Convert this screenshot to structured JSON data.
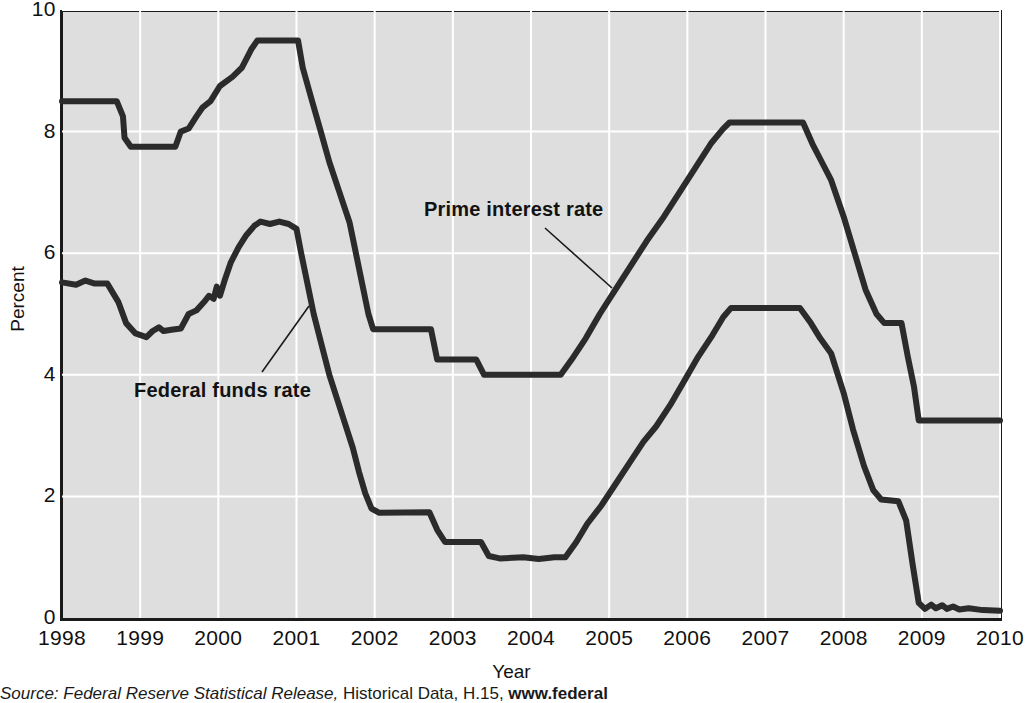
{
  "chart_data": {
    "type": "line",
    "title": "",
    "xlabel": "Year",
    "ylabel": "Percent",
    "xlim": [
      1998,
      2010
    ],
    "ylim": [
      0,
      10
    ],
    "xticks": [
      1998,
      1999,
      2000,
      2001,
      2002,
      2003,
      2004,
      2005,
      2006,
      2007,
      2008,
      2009,
      2010
    ],
    "yticks": [
      0,
      2,
      4,
      6,
      8,
      10
    ],
    "grid": true,
    "legend_position": "inline-annotation",
    "line_color": "#2b2b2b",
    "plot_background": "#dedede",
    "gridline_color": "#ffffff",
    "series": [
      {
        "name": "Prime interest rate",
        "label_position": {
          "x": 424,
          "y": 198
        },
        "points": [
          [
            1998.0,
            8.5
          ],
          [
            1998.7,
            8.5
          ],
          [
            1998.78,
            8.25
          ],
          [
            1998.8,
            7.9
          ],
          [
            1998.88,
            7.75
          ],
          [
            1999.45,
            7.75
          ],
          [
            1999.52,
            8.0
          ],
          [
            1999.62,
            8.05
          ],
          [
            1999.72,
            8.25
          ],
          [
            1999.8,
            8.4
          ],
          [
            1999.9,
            8.5
          ],
          [
            2000.02,
            8.75
          ],
          [
            2000.18,
            8.9
          ],
          [
            2000.3,
            9.05
          ],
          [
            2000.42,
            9.35
          ],
          [
            2000.5,
            9.5
          ],
          [
            2001.02,
            9.5
          ],
          [
            2001.08,
            9.05
          ],
          [
            2001.2,
            8.5
          ],
          [
            2001.3,
            8.05
          ],
          [
            2001.42,
            7.5
          ],
          [
            2001.55,
            7.0
          ],
          [
            2001.68,
            6.5
          ],
          [
            2001.76,
            6.0
          ],
          [
            2001.84,
            5.5
          ],
          [
            2001.92,
            5.0
          ],
          [
            2001.98,
            4.75
          ],
          [
            2002.72,
            4.75
          ],
          [
            2002.8,
            4.25
          ],
          [
            2003.3,
            4.25
          ],
          [
            2003.4,
            4.0
          ],
          [
            2004.38,
            4.0
          ],
          [
            2004.52,
            4.25
          ],
          [
            2004.7,
            4.6
          ],
          [
            2004.88,
            5.0
          ],
          [
            2005.08,
            5.4
          ],
          [
            2005.28,
            5.8
          ],
          [
            2005.48,
            6.2
          ],
          [
            2005.7,
            6.6
          ],
          [
            2005.9,
            7.0
          ],
          [
            2006.1,
            7.4
          ],
          [
            2006.3,
            7.8
          ],
          [
            2006.46,
            8.05
          ],
          [
            2006.54,
            8.15
          ],
          [
            2007.48,
            8.15
          ],
          [
            2007.6,
            7.8
          ],
          [
            2007.72,
            7.5
          ],
          [
            2007.84,
            7.2
          ],
          [
            2008.0,
            6.6
          ],
          [
            2008.14,
            6.0
          ],
          [
            2008.28,
            5.4
          ],
          [
            2008.42,
            5.0
          ],
          [
            2008.52,
            4.85
          ],
          [
            2008.74,
            4.85
          ],
          [
            2008.82,
            4.3
          ],
          [
            2008.9,
            3.8
          ],
          [
            2008.96,
            3.25
          ],
          [
            2010.0,
            3.25
          ]
        ]
      },
      {
        "name": "Federal funds rate",
        "label_position": {
          "x": 134,
          "y": 379
        },
        "points": [
          [
            1998.0,
            5.52
          ],
          [
            1998.18,
            5.48
          ],
          [
            1998.3,
            5.55
          ],
          [
            1998.42,
            5.5
          ],
          [
            1998.58,
            5.5
          ],
          [
            1998.72,
            5.2
          ],
          [
            1998.82,
            4.85
          ],
          [
            1998.94,
            4.68
          ],
          [
            1999.08,
            4.62
          ],
          [
            1999.16,
            4.72
          ],
          [
            1999.24,
            4.78
          ],
          [
            1999.3,
            4.72
          ],
          [
            1999.4,
            4.74
          ],
          [
            1999.52,
            4.76
          ],
          [
            1999.62,
            5.0
          ],
          [
            1999.72,
            5.06
          ],
          [
            1999.82,
            5.2
          ],
          [
            1999.88,
            5.3
          ],
          [
            1999.94,
            5.25
          ],
          [
            1999.98,
            5.45
          ],
          [
            2000.02,
            5.3
          ],
          [
            2000.08,
            5.55
          ],
          [
            2000.16,
            5.85
          ],
          [
            2000.26,
            6.1
          ],
          [
            2000.36,
            6.3
          ],
          [
            2000.46,
            6.45
          ],
          [
            2000.54,
            6.52
          ],
          [
            2000.66,
            6.48
          ],
          [
            2000.78,
            6.52
          ],
          [
            2000.9,
            6.48
          ],
          [
            2001.0,
            6.4
          ],
          [
            2001.06,
            6.0
          ],
          [
            2001.14,
            5.5
          ],
          [
            2001.22,
            5.0
          ],
          [
            2001.32,
            4.5
          ],
          [
            2001.42,
            4.0
          ],
          [
            2001.52,
            3.6
          ],
          [
            2001.62,
            3.2
          ],
          [
            2001.72,
            2.8
          ],
          [
            2001.8,
            2.4
          ],
          [
            2001.88,
            2.05
          ],
          [
            2001.96,
            1.8
          ],
          [
            2002.06,
            1.73
          ],
          [
            2002.7,
            1.74
          ],
          [
            2002.8,
            1.45
          ],
          [
            2002.9,
            1.25
          ],
          [
            2003.36,
            1.25
          ],
          [
            2003.46,
            1.02
          ],
          [
            2003.6,
            0.98
          ],
          [
            2003.9,
            1.0
          ],
          [
            2004.1,
            0.97
          ],
          [
            2004.3,
            1.0
          ],
          [
            2004.44,
            1.0
          ],
          [
            2004.58,
            1.25
          ],
          [
            2004.72,
            1.55
          ],
          [
            2004.9,
            1.85
          ],
          [
            2005.08,
            2.2
          ],
          [
            2005.26,
            2.55
          ],
          [
            2005.44,
            2.9
          ],
          [
            2005.6,
            3.15
          ],
          [
            2005.78,
            3.5
          ],
          [
            2005.96,
            3.9
          ],
          [
            2006.14,
            4.3
          ],
          [
            2006.32,
            4.65
          ],
          [
            2006.46,
            4.95
          ],
          [
            2006.56,
            5.1
          ],
          [
            2007.44,
            5.1
          ],
          [
            2007.58,
            4.85
          ],
          [
            2007.7,
            4.6
          ],
          [
            2007.84,
            4.35
          ],
          [
            2008.0,
            3.7
          ],
          [
            2008.12,
            3.1
          ],
          [
            2008.26,
            2.5
          ],
          [
            2008.38,
            2.1
          ],
          [
            2008.48,
            1.95
          ],
          [
            2008.7,
            1.92
          ],
          [
            2008.8,
            1.6
          ],
          [
            2008.88,
            0.9
          ],
          [
            2008.96,
            0.25
          ],
          [
            2009.04,
            0.15
          ],
          [
            2009.12,
            0.22
          ],
          [
            2009.18,
            0.16
          ],
          [
            2009.26,
            0.21
          ],
          [
            2009.32,
            0.15
          ],
          [
            2009.4,
            0.19
          ],
          [
            2009.48,
            0.14
          ],
          [
            2009.6,
            0.16
          ],
          [
            2009.78,
            0.13
          ],
          [
            2010.0,
            0.12
          ]
        ]
      }
    ],
    "annotations": [
      {
        "text": "Prime interest rate",
        "leader_from": {
          "x": 545,
          "y": 228
        },
        "leader_to": {
          "x": 612,
          "y": 288
        }
      },
      {
        "text": "Federal funds rate",
        "leader_from": {
          "x": 262,
          "y": 372
        },
        "leader_to": {
          "x": 309,
          "y": 306
        }
      }
    ]
  },
  "axis": {
    "y_title": "Percent",
    "x_title": "Year",
    "y_tick_labels": [
      "10",
      "8",
      "6",
      "4",
      "2",
      "0"
    ],
    "x_tick_labels": [
      "1998",
      "1999",
      "2000",
      "2001",
      "2002",
      "2003",
      "2004",
      "2005",
      "2006",
      "2007",
      "2008",
      "2009",
      "2010"
    ]
  },
  "source": {
    "prefix": "Source: ",
    "italic_text": "Federal Reserve Statistical Release,",
    "plain_text": " Historical Data, H.15, ",
    "bold_text": "www.federal"
  }
}
